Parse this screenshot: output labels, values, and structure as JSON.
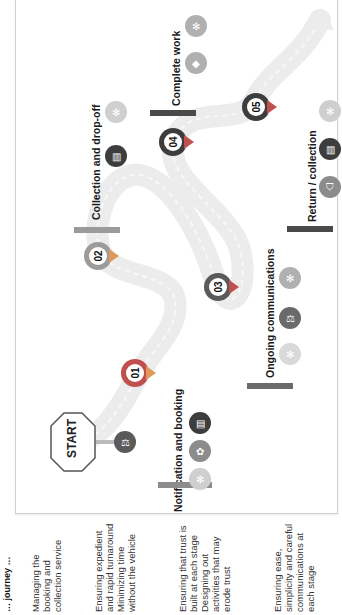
{
  "title_partial": "… journey …",
  "start_sign": {
    "label": "START"
  },
  "colors": {
    "dark_pin": "#3d3d3d",
    "red_accent": "#c0504d",
    "orange_accent": "#e1995a",
    "gray_pin": "#7f7f7f",
    "light_gray_icon": "#bfbfbf",
    "bar_gray": "#8c8c8c",
    "bar_dark": "#4a4a4a",
    "road": "#ededed"
  },
  "stages": [
    {
      "number": "01",
      "label": "Notification and booking",
      "icons": [
        "handshake-icon",
        "calendar-board-icon",
        "people-icon"
      ]
    },
    {
      "number": "02",
      "label": "Collection and drop-off",
      "icons": [
        "sign-board-icon",
        "people-icon"
      ]
    },
    {
      "number": "03",
      "label": "Ongoing communications",
      "icons": [
        "people-icon",
        "handshake-icon",
        "people-icon"
      ]
    },
    {
      "number": "04",
      "label": "Complete work",
      "icons": [
        "car-icon",
        "people-icon"
      ]
    },
    {
      "number": "05",
      "label": "Return / collection",
      "icons": [
        "shield-icon",
        "sign-board-icon",
        "people-icon"
      ]
    }
  ],
  "descriptions": [
    {
      "text": "Managing the booking and collection service"
    },
    {
      "text": "Ensuring expedient and rapid turnaround Minimizing time without the vehicle"
    },
    {
      "text": "Ensuring that trust is built at each stage Designing out activities that may erode trust"
    },
    {
      "text": "Ensuring ease, simplicity and careful communications at each stage"
    }
  ]
}
